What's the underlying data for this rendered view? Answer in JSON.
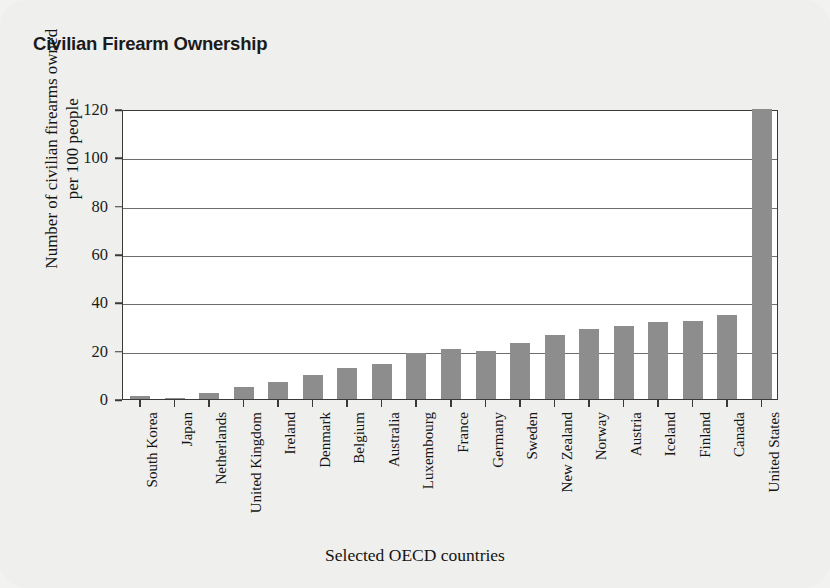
{
  "chart_data": {
    "type": "bar",
    "title": "Civilian Firearm Ownership",
    "xlabel": "Selected OECD countries",
    "ylabel_line1": "Number of civilian firearms owned",
    "ylabel_line2": "per 100 people",
    "ylabel": "Number of civilian firearms owned per 100 people",
    "ylim": [
      0,
      120
    ],
    "yticks": [
      0,
      20,
      40,
      60,
      80,
      100,
      120
    ],
    "ytick_labels": [
      "0",
      "20",
      "40",
      "60",
      "80",
      "100",
      "120"
    ],
    "grid": "horizontal",
    "legend": "none",
    "bar_color": "#8d8d8d",
    "plot_background": "#ffffff",
    "card_background": "#efefed",
    "categories": [
      "South Korea",
      "Japan",
      "Netherlands",
      "United Kingdom",
      "Ireland",
      "Denmark",
      "Belgium",
      "Australia",
      "Luxembourg",
      "France",
      "Germany",
      "Sweden",
      "New Zealand",
      "Norway",
      "Austria",
      "Iceland",
      "Finland",
      "Canada",
      "United States"
    ],
    "values": [
      1.1,
      0.6,
      2.6,
      5.0,
      7.2,
      9.9,
      12.7,
      14.5,
      18.9,
      20.5,
      20.0,
      23.1,
      26.3,
      28.8,
      30.4,
      31.7,
      32.4,
      34.7,
      120.5
    ]
  }
}
